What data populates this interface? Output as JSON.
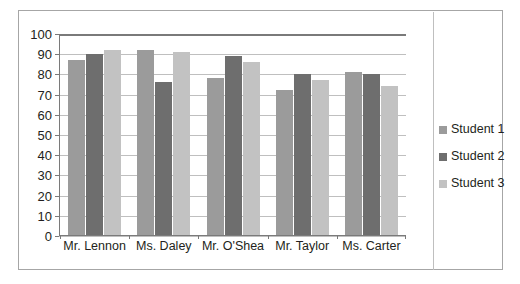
{
  "chart_data": {
    "type": "bar",
    "title": "",
    "subtitle": "",
    "xlabel": "",
    "ylabel": "",
    "categories": [
      "Mr. Lennon",
      "Ms. Daley",
      "Mr. O'Shea",
      "Mr. Taylor",
      "Ms. Carter"
    ],
    "series": [
      {
        "name": "Student 1",
        "color": "#9b9b9b",
        "values": [
          87,
          92,
          78,
          72,
          81
        ]
      },
      {
        "name": "Student 2",
        "color": "#6e6e6e",
        "values": [
          90,
          76,
          89,
          80,
          80
        ]
      },
      {
        "name": "Student 3",
        "color": "#c2c2c2",
        "values": [
          92,
          91,
          86,
          77,
          74
        ]
      }
    ],
    "ylim": [
      0,
      100
    ],
    "ytick_step": 10,
    "yticks": [
      100,
      90,
      80,
      70,
      60,
      50,
      40,
      30,
      20,
      10,
      0
    ],
    "ytick_labels": [
      "100",
      "90",
      "80",
      "70",
      "60",
      "50",
      "40",
      "30",
      "20",
      "10",
      "0"
    ],
    "grid": true,
    "grid_axis": "y",
    "legend_position": "right",
    "legend_entries": [
      "Student 1",
      "Student 2",
      "Student 3"
    ],
    "annotations": []
  },
  "colors": {
    "series_1": "#9b9b9b",
    "series_2": "#6e6e6e",
    "series_3": "#c2c2c2",
    "gridline": "#bfbfbf",
    "axis": "#7a7a7a",
    "border": "#a6a6a6",
    "plot_background": "#ffffff",
    "text": "#231f20"
  }
}
